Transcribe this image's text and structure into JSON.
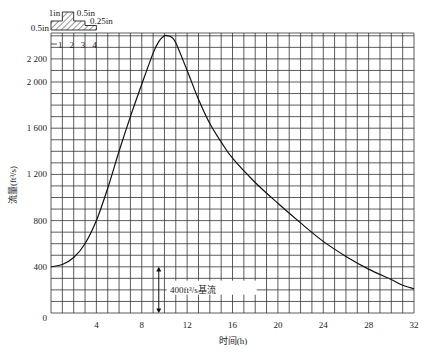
{
  "chart_data": {
    "type": "line",
    "title": "",
    "xlabel": "时间(h)",
    "ylabel": "流量(ft³/s)",
    "x_ticks": [
      4,
      8,
      12,
      16,
      20,
      24,
      28,
      32
    ],
    "y_ticks": [
      0,
      400,
      800,
      1200,
      1600,
      2000,
      2200
    ],
    "y_tick_labels": [
      "0",
      "400",
      "800",
      "1 200",
      "1 600",
      "2 000",
      "2 200"
    ],
    "xlim": [
      0,
      32
    ],
    "ylim": [
      0,
      2400
    ],
    "grid": true,
    "series": [
      {
        "name": "hydrograph",
        "x": [
          0,
          1,
          2,
          3,
          4,
          5,
          6,
          7,
          8,
          9,
          9.5,
          10,
          10.3,
          10.6,
          11,
          12,
          13,
          14,
          15,
          16,
          18,
          20,
          22,
          24,
          26,
          28,
          30,
          31,
          32
        ],
        "y": [
          400,
          420,
          480,
          600,
          800,
          1080,
          1400,
          1700,
          1980,
          2250,
          2350,
          2400,
          2400,
          2390,
          2340,
          2100,
          1850,
          1640,
          1480,
          1340,
          1130,
          950,
          780,
          620,
          490,
          380,
          290,
          240,
          210
        ]
      }
    ],
    "annotations": [
      {
        "text": "400ft³/s基流",
        "x": 12,
        "y": 200,
        "arrow": "vertical double arrow spanning 0–400 at t≈9.5"
      }
    ],
    "hyetograph": {
      "time_labels": [
        "1",
        "2",
        "3",
        "4"
      ],
      "blocks": [
        {
          "hour": 1,
          "depth_label": "0.5in"
        },
        {
          "hour": 2,
          "depth_label": "1in"
        },
        {
          "hour": 3,
          "depth_label": "0.5in"
        },
        {
          "hour": 4,
          "depth_label": "0.25in"
        }
      ]
    }
  },
  "labels": {
    "xlabel": "时间(h)",
    "ylabel": "流量(ft³/s)",
    "baseflow": "400ft³/s基流",
    "rain_05a": "0.5in",
    "rain_1": "1in",
    "rain_05b": "0.5in",
    "rain_025": "0.25in"
  }
}
